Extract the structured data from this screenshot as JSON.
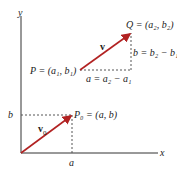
{
  "axes": {
    "x_label": "x",
    "y_label": "y"
  },
  "vectors": {
    "v": {
      "label": "v",
      "from": "P",
      "to": "Q"
    },
    "v0": {
      "label": "v",
      "subscript": "0",
      "from": "origin",
      "to": "P0"
    }
  },
  "points": {
    "P": "P = (a₁, b₁)",
    "Q": "Q = (a₂, b₂)",
    "P0": "P₀ = (a, b)"
  },
  "components": {
    "a": "a = a₂ − a₁",
    "b": "b = b₂ − b₁"
  },
  "ticks": {
    "x": "a",
    "y": "b"
  },
  "colors": {
    "vector": "#b22222",
    "axis": "#333333",
    "dashed": "#555555"
  }
}
